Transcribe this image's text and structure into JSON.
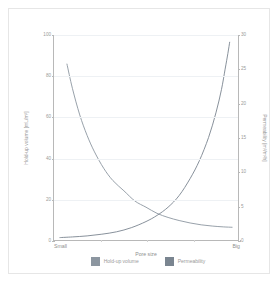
{
  "chart_data": {
    "type": "line",
    "title": "",
    "subtitle": "",
    "xlabel": "Pore size",
    "xlim": [
      0,
      1
    ],
    "x_tick_labels": [
      "Small",
      "Big"
    ],
    "x_tick_positions": [
      0,
      1
    ],
    "grid": true,
    "legend_position": "bottom",
    "axes": [
      {
        "side": "left",
        "label": "Hold-up volume [mL/m²]",
        "ylim": [
          0,
          100
        ],
        "ticks": [
          0,
          20,
          40,
          60,
          80,
          100
        ],
        "tick_labels": [
          "0",
          "20",
          "40",
          "60",
          "80",
          "100"
        ],
        "color": "#9a9a9a"
      },
      {
        "side": "right",
        "label": "Permeability [m³/m²h]",
        "ylim": [
          0,
          30
        ],
        "ticks": [
          0,
          5,
          10,
          15,
          20,
          25,
          30
        ],
        "tick_labels": [
          "0",
          "5",
          "10",
          "15",
          "20",
          "25",
          "30"
        ],
        "color": "#9a9a9a"
      }
    ],
    "series": [
      {
        "name": "Hold-up volume",
        "axis": "left",
        "color": "#8c96a0",
        "x": [
          0.07,
          0.1,
          0.14,
          0.18,
          0.22,
          0.27,
          0.32,
          0.38,
          0.44,
          0.5,
          0.56,
          0.62,
          0.68,
          0.74,
          0.8,
          0.86,
          0.92,
          0.97
        ],
        "values": [
          86,
          74,
          61,
          51,
          43,
          35,
          29,
          24,
          19,
          16,
          13,
          11,
          9.5,
          8.3,
          7.4,
          6.8,
          6.4,
          6.2
        ]
      },
      {
        "name": "Permeability",
        "axis": "right",
        "color": "#7a8590",
        "x": [
          0.03,
          0.1,
          0.18,
          0.26,
          0.34,
          0.42,
          0.5,
          0.56,
          0.62,
          0.68,
          0.74,
          0.79,
          0.84,
          0.88,
          0.91,
          0.93,
          0.945,
          0.955
        ],
        "values": [
          0.35,
          0.45,
          0.6,
          0.85,
          1.2,
          1.8,
          2.7,
          3.6,
          4.8,
          6.5,
          9.0,
          11.6,
          15.0,
          18.6,
          22.0,
          25.0,
          27.3,
          29.0
        ]
      }
    ],
    "annotations": []
  },
  "legend": {
    "items": [
      {
        "label": "Hold-up volume",
        "color": "#8c96a0"
      },
      {
        "label": "Permeability",
        "color": "#7a8590"
      }
    ]
  },
  "figure": {
    "background": "#ffffff",
    "frame_color": "#e6e6e6",
    "axis_color": "#b8b8b8",
    "grid_color": "#eef1f4",
    "text_color": "#9a9a9a"
  }
}
